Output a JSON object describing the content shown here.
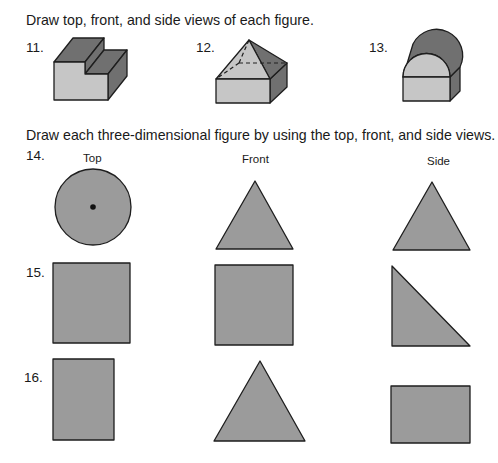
{
  "section1": {
    "instruction": "Draw top, front, and side views of each figure.",
    "exercises": [
      {
        "number": "11.",
        "figure": "l-shaped-step-prism"
      },
      {
        "number": "12.",
        "figure": "pyramid-on-rectangular-prism"
      },
      {
        "number": "13.",
        "figure": "half-cylinder-on-rectangular-prism"
      }
    ]
  },
  "section2": {
    "instruction": "Draw each three-dimensional figure by using the top, front, and side views.",
    "column_labels": {
      "top": "Top",
      "front": "Front",
      "side": "Side"
    },
    "exercises": [
      {
        "number": "14.",
        "top": "circle-with-center-dot",
        "front": "triangle",
        "side": "triangle"
      },
      {
        "number": "15.",
        "top": "square",
        "front": "square",
        "side": "right-triangle"
      },
      {
        "number": "16.",
        "top": "rectangle-tall",
        "front": "triangle",
        "side": "rectangle-wide"
      }
    ]
  },
  "colors": {
    "view_fill": "#9b9b9b",
    "light_face": "#c6c6c6",
    "dark_face": "#707070",
    "stroke": "#1e1e1e"
  }
}
